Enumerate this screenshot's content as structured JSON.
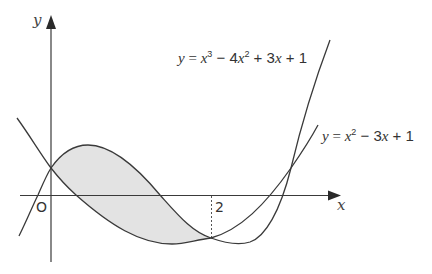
{
  "diagram": {
    "type": "function-graph",
    "axes": {
      "x_label": "x",
      "y_label": "y",
      "origin_label": "O",
      "tick_labels": [
        "2"
      ]
    },
    "curves": [
      {
        "name": "cubic",
        "equation_parts": {
          "lhs": "y",
          "eq": " = ",
          "t1": "x",
          "p1": "3",
          "op1": " − 4",
          "t2": "x",
          "p2": "2",
          "op2": " + 3",
          "t3": "x",
          "tail": " + 1"
        },
        "equation": "y = x^3 − 4x^2 + 3x + 1"
      },
      {
        "name": "quadratic",
        "equation_parts": {
          "lhs": "y",
          "eq": " = ",
          "t1": "x",
          "p1": "2",
          "op1": " − 3",
          "t2": "x",
          "tail": " + 1"
        },
        "equation": "y = x^2 − 3x + 1"
      }
    ],
    "intersections": [
      {
        "x": 0,
        "y": 1
      },
      {
        "x": 2,
        "y": -1
      },
      {
        "x": 3,
        "y": 1
      }
    ],
    "shaded_region": "Region enclosed between the two curves from x = 0 to x = 2",
    "colors": {
      "line": "#3a3a3a",
      "shade": "#e3e3e3",
      "background": "#ffffff"
    }
  }
}
